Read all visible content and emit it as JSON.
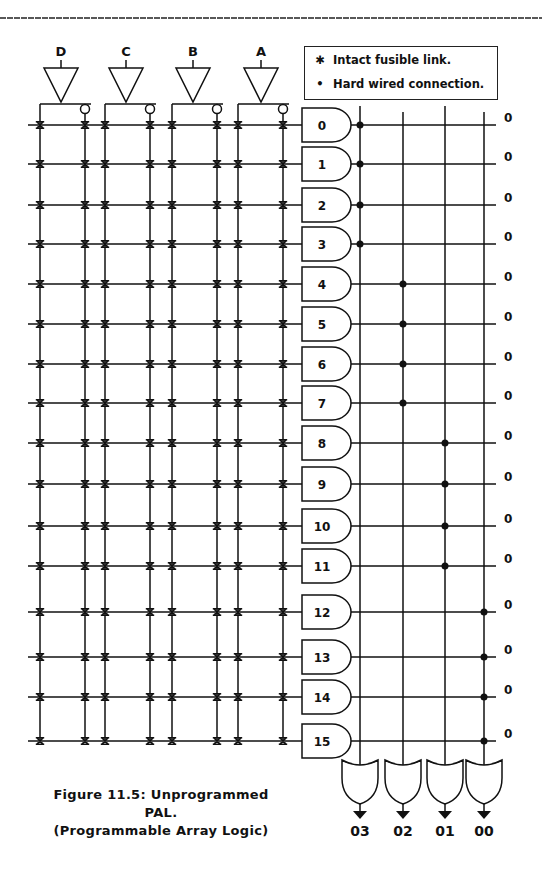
{
  "inputs": [
    {
      "label": "D",
      "x": 61
    },
    {
      "label": "C",
      "x": 126
    },
    {
      "label": "B",
      "x": 193
    },
    {
      "label": "A",
      "x": 261
    }
  ],
  "legend": {
    "fuse_label": "Intact fusible link.",
    "hardwire_label": "Hard wired connection."
  },
  "and_gates": [
    {
      "id": "0",
      "y": 125,
      "output": "0",
      "or_group": 0
    },
    {
      "id": "1",
      "y": 164,
      "output": "0",
      "or_group": 0
    },
    {
      "id": "2",
      "y": 205,
      "output": "0",
      "or_group": 0
    },
    {
      "id": "3",
      "y": 244,
      "output": "0",
      "or_group": 0
    },
    {
      "id": "4",
      "y": 284,
      "output": "0",
      "or_group": 1
    },
    {
      "id": "5",
      "y": 324,
      "output": "0",
      "or_group": 1
    },
    {
      "id": "6",
      "y": 364,
      "output": "0",
      "or_group": 1
    },
    {
      "id": "7",
      "y": 403,
      "output": "0",
      "or_group": 1
    },
    {
      "id": "8",
      "y": 443,
      "output": "0",
      "or_group": 2
    },
    {
      "id": "9",
      "y": 484,
      "output": "0",
      "or_group": 2
    },
    {
      "id": "10",
      "y": 526,
      "output": "0",
      "or_group": 2
    },
    {
      "id": "11",
      "y": 566,
      "output": "0",
      "or_group": 2
    },
    {
      "id": "12",
      "y": 612,
      "output": "0",
      "or_group": 3
    },
    {
      "id": "13",
      "y": 657,
      "output": "0",
      "or_group": 3
    },
    {
      "id": "14",
      "y": 697,
      "output": "0",
      "or_group": 3
    },
    {
      "id": "15",
      "y": 741,
      "output": "0",
      "or_group": 3
    }
  ],
  "or_gates": [
    {
      "label": "03",
      "x": 360
    },
    {
      "label": "02",
      "x": 403
    },
    {
      "label": "01",
      "x": 445
    },
    {
      "label": "00",
      "x": 484
    }
  ],
  "grid_columns": [
    40,
    85,
    105,
    150,
    172,
    217,
    238,
    283
  ],
  "caption": {
    "line1": "Figure 11.5: Unprogrammed PAL.",
    "line2": "(Programmable Array Logic)"
  },
  "colors": {
    "ink": "#111111",
    "background": "#ffffff"
  }
}
